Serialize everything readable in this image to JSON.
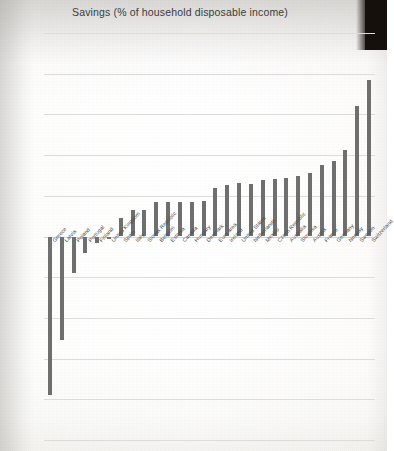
{
  "chart_data": {
    "type": "bar",
    "title": "Savings (% of household disposable income)",
    "xlabel": "",
    "ylabel": "",
    "ylim": [
      -25,
      25
    ],
    "ytick_step": 5,
    "ytick_labels": [
      "25.00",
      "20.00",
      "15.00",
      "10.00",
      "5.00",
      "0.00",
      "-5.00",
      "-10.00",
      "-15.00",
      "-20.00",
      "-25.00"
    ],
    "ytick_values": [
      25,
      20,
      15,
      10,
      5,
      0,
      -5,
      -10,
      -15,
      -20,
      -25
    ],
    "grid": true,
    "legend": false,
    "bar_color": "#6f6f6f",
    "categories": [
      "Greece",
      "Latvia",
      "Poland",
      "Portugal",
      "Finland",
      "United Kingdom",
      "Spain",
      "Italy",
      "Slovak Republic",
      "Belgium",
      "Estonia",
      "Canada",
      "Hungary",
      "Denmark",
      "Euro area",
      "Ireland",
      "United States",
      "Netherlands",
      "Mexico",
      "Czech Republic",
      "Australia",
      "Slovenia",
      "Austria",
      "France",
      "Germany",
      "Norway",
      "Sweden",
      "Switzerland"
    ],
    "values": [
      -19.5,
      -12.7,
      -4.5,
      -2.0,
      -0.8,
      -0.3,
      2.3,
      3.2,
      3.3,
      4.2,
      4.2,
      4.2,
      4.2,
      4.3,
      6.0,
      6.3,
      6.6,
      6.5,
      7.0,
      7.1,
      7.2,
      7.4,
      7.8,
      8.8,
      9.3,
      10.6,
      16.0,
      19.2
    ]
  },
  "artifacts": {
    "dark_band_color": "#15100c"
  }
}
